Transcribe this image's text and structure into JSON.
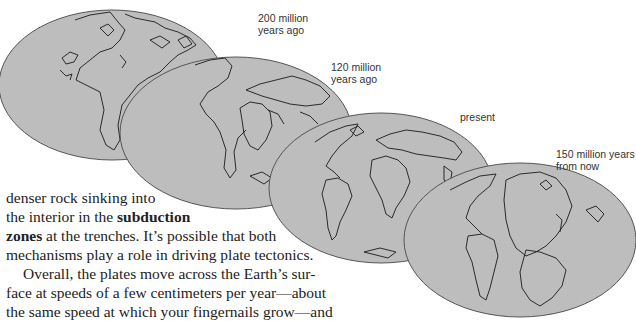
{
  "figure": {
    "maps": [
      {
        "label": "200 million\nyears ago",
        "fill": "#bdbdbd"
      },
      {
        "label": "120 million\nyears ago",
        "fill": "#bdbdbd"
      },
      {
        "label": "present",
        "fill": "#bdbdbd"
      },
      {
        "label": "150 million years\nfrom now",
        "fill": "#bdbdbd"
      }
    ],
    "outline_color": "#555555",
    "coast_color": "#1a1a1a"
  },
  "text": {
    "line1": "denser rock sinking into",
    "line2_pre": "the interior in the ",
    "line2_bold": "subduction",
    "line3_bold": "zones",
    "line3_post": " at the trenches. It’s possible that both",
    "line4": "mechanisms play a role in driving plate tectonics.",
    "line5": "Overall, the plates move across the Earth’s sur-",
    "line6": "face at speeds of a few centimeters per year—about",
    "line7": "the same speed at which your fingernails grow—and",
    "line8": "we can use this motion to project the locations of the"
  }
}
